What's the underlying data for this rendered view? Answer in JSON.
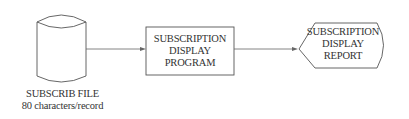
{
  "diagram": {
    "type": "system flowchart",
    "nodes": [
      {
        "id": "file",
        "shape": "disk-storage",
        "caption_lines": [
          "SUBSCRIB FILE",
          "80 characters/record"
        ]
      },
      {
        "id": "program",
        "shape": "process",
        "label_lines": [
          "SUBSCRIPTION",
          "DISPLAY",
          "PROGRAM"
        ]
      },
      {
        "id": "report",
        "shape": "display",
        "label_lines": [
          "SUBSCRIPTION",
          "DISPLAY",
          "REPORT"
        ]
      }
    ],
    "edges": [
      {
        "from": "file",
        "to": "program"
      },
      {
        "from": "program",
        "to": "report"
      }
    ]
  },
  "file": {
    "line1": "SUBSCRIB FILE",
    "line2": "80 characters/record"
  },
  "program": {
    "line1": "SUBSCRIPTION",
    "line2": "DISPLAY",
    "line3": "PROGRAM"
  },
  "report": {
    "line1": "SUBSCRIPTION",
    "line2": "DISPLAY",
    "line3": "REPORT"
  },
  "colors": {
    "stroke": "#555555",
    "text": "#333333",
    "background": "#ffffff"
  }
}
